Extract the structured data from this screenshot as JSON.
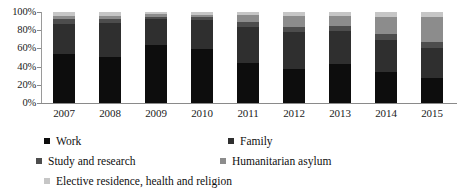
{
  "chart_data": {
    "type": "bar",
    "subtype": "100% stacked column",
    "title": "",
    "xlabel": "",
    "ylabel": "",
    "categories": [
      "2007",
      "2008",
      "2009",
      "2010",
      "2011",
      "2012",
      "2013",
      "2014",
      "2015"
    ],
    "ylim": [
      0,
      100
    ],
    "y_tick_labels": [
      "0%",
      "20%",
      "40%",
      "60%",
      "80%",
      "100%"
    ],
    "y_ticks": [
      0,
      20,
      40,
      60,
      80,
      100
    ],
    "grid": false,
    "legend_position": "bottom",
    "value_unit": "percent",
    "series": [
      {
        "name": "Work",
        "color": "#0d0d0d",
        "values": [
          54,
          51,
          64,
          59,
          44,
          37,
          43,
          34,
          27
        ]
      },
      {
        "name": "Family",
        "color": "#2f2f2f",
        "values": [
          33,
          37,
          28,
          32,
          40,
          41,
          36,
          35,
          33
        ]
      },
      {
        "name": "Study and research",
        "color": "#4d4d4d",
        "values": [
          5,
          4,
          3,
          3,
          5,
          6,
          6,
          7,
          7
        ]
      },
      {
        "name": "Humanitarian asylum",
        "color": "#8c8c8c",
        "values": [
          4,
          4,
          3,
          3,
          8,
          12,
          11,
          18,
          27
        ]
      },
      {
        "name": "Elective residence, health and religion",
        "color": "#c6c6c6",
        "values": [
          4,
          4,
          2,
          3,
          3,
          4,
          4,
          6,
          6
        ]
      }
    ]
  },
  "legend": {
    "items": [
      {
        "label": "Work",
        "color": "#0d0d0d"
      },
      {
        "label": "Family",
        "color": "#2f2f2f"
      },
      {
        "label": "Study and research",
        "color": "#4d4d4d"
      },
      {
        "label": "Humanitarian asylum",
        "color": "#8c8c8c"
      },
      {
        "label": "Elective residence, health and religion",
        "color": "#c6c6c6"
      }
    ]
  }
}
